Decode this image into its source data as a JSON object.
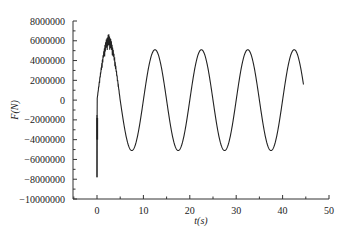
{
  "chart_data": {
    "type": "line",
    "title": "",
    "xlabel": "t(s)",
    "ylabel": "F(N)",
    "xlim": [
      -5,
      50
    ],
    "ylim": [
      -10000000,
      8000000
    ],
    "x_ticks": [
      0,
      10,
      20,
      30,
      40,
      50
    ],
    "x_tick_labels": [
      "0",
      "10",
      "20",
      "30",
      "40",
      "50"
    ],
    "y_ticks": [
      8000000,
      6000000,
      4000000,
      2000000,
      0,
      -2000000,
      -4000000,
      -6000000,
      -8000000,
      -10000000
    ],
    "y_tick_labels": [
      "8000000",
      "6000000",
      "4000000",
      "2000000",
      "0",
      "-2000000",
      "-4000000",
      "-6000000",
      "-8000000",
      "-10000000"
    ],
    "grid": false,
    "legend": null,
    "series": [
      {
        "name": "F",
        "color": "#222222",
        "description": "Sinusoidal force with ~10 s period, amplitude ~5.1e6 N; initial transient with spike to about -7.8e6 at t≈0 and noisy overshoot up to ~6.7e6 near t≈2.5 s; record ends at t≈44.5 s near 1.8e6 N",
        "period": 10,
        "amplitude": 5100000,
        "x": [
          0,
          0.1,
          0.5,
          1.0,
          1.5,
          2.0,
          2.5,
          3.0,
          4.0,
          5.0,
          6.0,
          7.5,
          9.0,
          10.0,
          11.0,
          12.5,
          14.0,
          15.0,
          16.0,
          17.5,
          19.0,
          20.0,
          21.0,
          22.5,
          24.0,
          25.0,
          26.0,
          27.5,
          29.0,
          30.0,
          31.0,
          32.5,
          34.0,
          35.0,
          36.0,
          37.5,
          39.0,
          40.0,
          41.0,
          42.5,
          44.0,
          44.5
        ],
        "values": [
          -7800000,
          -2000000,
          0,
          2500000,
          4200000,
          5000000,
          6700000,
          4900000,
          3000000,
          0,
          -3000000,
          -5100000,
          -3000000,
          0,
          3000000,
          5100000,
          3000000,
          0,
          -3000000,
          -5100000,
          -3000000,
          0,
          3000000,
          5100000,
          3000000,
          0,
          -3000000,
          -5100000,
          -3000000,
          0,
          3000000,
          5100000,
          3000000,
          0,
          -3000000,
          -5100000,
          -3000000,
          0,
          3000000,
          5100000,
          3000000,
          1800000
        ]
      }
    ]
  }
}
